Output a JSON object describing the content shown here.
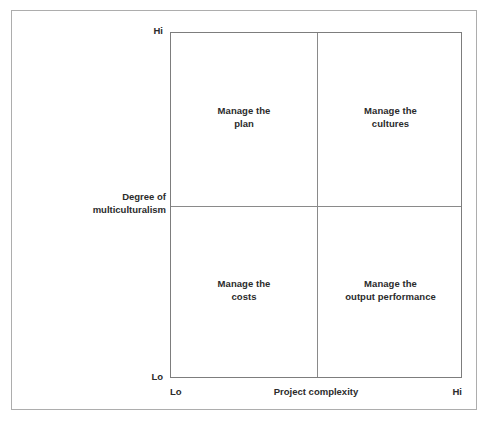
{
  "chart_data": {
    "type": "table",
    "title": "",
    "xlabel": "Project complexity",
    "ylabel": "Degree of multiculturalism",
    "x_ticks": [
      "Lo",
      "Hi"
    ],
    "y_ticks": [
      "Lo",
      "Hi"
    ],
    "grid": true,
    "legend": "none",
    "quadrants": [
      {
        "position": "top-left",
        "x": "Lo",
        "y": "Hi",
        "line1": "Manage the",
        "line2": "plan"
      },
      {
        "position": "top-right",
        "x": "Hi",
        "y": "Hi",
        "line1": "Manage the",
        "line2": "cultures"
      },
      {
        "position": "bottom-left",
        "x": "Lo",
        "y": "Lo",
        "line1": "Manage the",
        "line2": "costs"
      },
      {
        "position": "bottom-right",
        "x": "Hi",
        "y": "Lo",
        "line1": "Manage the",
        "line2": "output performance"
      }
    ]
  },
  "axes": {
    "y": {
      "title_line1": "Degree of",
      "title_line2": "multiculturalism",
      "tick_high": "Hi",
      "tick_low": "Lo"
    },
    "x": {
      "title": "Project complexity",
      "tick_low": "Lo",
      "tick_high": "Hi"
    }
  },
  "colors": {
    "text": "#2b2b2b",
    "plot_border": "#7d7d7d",
    "divider": "#8a8a8a",
    "outer_frame": "#adadad",
    "background": "#ffffff"
  }
}
